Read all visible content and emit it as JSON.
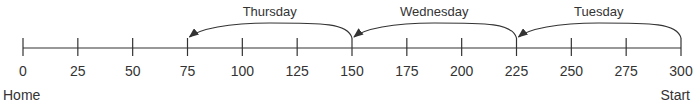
{
  "number_line": {
    "min": 0,
    "max": 300,
    "step": 25,
    "ticks": [
      "0",
      "25",
      "50",
      "75",
      "100",
      "125",
      "150",
      "175",
      "200",
      "225",
      "250",
      "275",
      "300"
    ],
    "left_end_label": "Home",
    "right_end_label": "Start",
    "line_color": "#333333"
  },
  "jumps": [
    {
      "label": "Tuesday",
      "from": 300,
      "to": 225
    },
    {
      "label": "Wednesday",
      "from": 225,
      "to": 150
    },
    {
      "label": "Thursday",
      "from": 150,
      "to": 75
    }
  ]
}
